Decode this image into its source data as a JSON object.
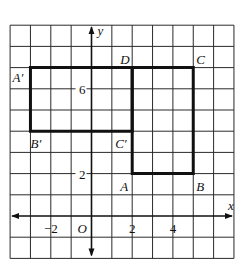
{
  "diagram": {
    "grid": {
      "x_min": -4,
      "x_max": 7,
      "y_min": -2,
      "y_max": 9
    },
    "axes": {
      "x_label": "x",
      "y_label": "y",
      "origin_label": "O"
    },
    "tick_labels": [
      {
        "axis": "x",
        "value": -2,
        "text": "−2"
      },
      {
        "axis": "x",
        "value": 2,
        "text": "2"
      },
      {
        "axis": "x",
        "value": 4,
        "text": "4"
      },
      {
        "axis": "y",
        "value": 2,
        "text": "2"
      },
      {
        "axis": "y",
        "value": 6,
        "text": "6"
      }
    ],
    "shapes": [
      {
        "name": "rectangle-ABCD",
        "vertices": [
          {
            "label": "A",
            "x": 2,
            "y": 2
          },
          {
            "label": "B",
            "x": 5,
            "y": 2
          },
          {
            "label": "C",
            "x": 5,
            "y": 7
          },
          {
            "label": "D",
            "x": 2,
            "y": 7
          }
        ]
      },
      {
        "name": "rectangle-A'B'C'D",
        "vertices": [
          {
            "label": "A′",
            "x": -3,
            "y": 7
          },
          {
            "label": "B′",
            "x": -3,
            "y": 4
          },
          {
            "label": "C′",
            "x": 2,
            "y": 4
          },
          {
            "label": "D",
            "x": 2,
            "y": 7
          }
        ]
      }
    ],
    "point_labels": [
      {
        "text": "A",
        "x": 2,
        "y": 2,
        "dx": -12,
        "dy": 17
      },
      {
        "text": "B",
        "x": 5,
        "y": 2,
        "dx": 3,
        "dy": 17
      },
      {
        "text": "C",
        "x": 5,
        "y": 7,
        "dx": 3,
        "dy": -4
      },
      {
        "text": "D",
        "x": 2,
        "y": 7,
        "dx": -12,
        "dy": -4
      },
      {
        "text": "A′",
        "x": -3,
        "y": 7,
        "dx": -18,
        "dy": 14
      },
      {
        "text": "B′",
        "x": -3,
        "y": 4,
        "dx": 0,
        "dy": 17
      },
      {
        "text": "C′",
        "x": 2,
        "y": 4,
        "dx": -17,
        "dy": 17
      }
    ]
  }
}
